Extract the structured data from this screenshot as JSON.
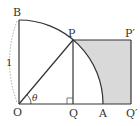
{
  "diagram": {
    "colors": {
      "line": "#333333",
      "shade": "#d9d9d9",
      "dashed_arc": "#999999"
    },
    "labels": {
      "B": "B",
      "P": "P",
      "P_prime": "P′",
      "O": "O",
      "Q": "Q",
      "A": "A",
      "Q_prime": "Q′",
      "theta": "θ",
      "radius": "1"
    },
    "points": {
      "O": [
        19,
        104
      ],
      "B": [
        19,
        20
      ],
      "P": [
        73,
        40
      ],
      "P_prime": [
        131,
        40
      ],
      "Q": [
        73,
        104
      ],
      "A": [
        103,
        104
      ],
      "Q_prime": [
        131,
        104
      ]
    },
    "radius_px": 84
  }
}
